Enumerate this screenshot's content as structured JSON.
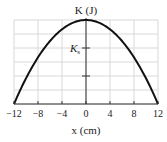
{
  "chart_data": {
    "type": "line",
    "title": "",
    "xlabel": "x (cm)",
    "ylabel": "K (J)",
    "y_tick_label": "Ks",
    "xlim": [
      -12,
      12
    ],
    "ylim": [
      0,
      3
    ],
    "x_ticks": [
      -12,
      -8,
      -4,
      0,
      4,
      8,
      12
    ],
    "x_tick_labels": [
      "−12",
      "−8",
      "−4",
      "0",
      "4",
      "8",
      "12"
    ],
    "y_ticks_marked": [
      1,
      2
    ],
    "y_tick_annotations": [
      {
        "value": 2,
        "label": "Ks"
      }
    ],
    "grid": true,
    "series": [
      {
        "name": "K(x)",
        "description": "parabola K = Kmax(1 - x^2/144), Kmax = 3 units",
        "x": [
          -12,
          -10,
          -8,
          -6,
          -4,
          -2,
          0,
          2,
          4,
          6,
          8,
          10,
          12
        ],
        "values": [
          0,
          0.917,
          1.667,
          2.25,
          2.667,
          2.917,
          3,
          2.917,
          2.667,
          2.25,
          1.667,
          0.917,
          0
        ]
      }
    ]
  }
}
